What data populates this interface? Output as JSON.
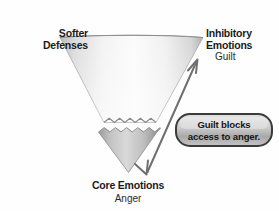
{
  "diagram": {
    "background_color": "#fefefe",
    "funnel": {
      "name": "inverted-triangle-funnel",
      "upper_section_label": "Softer Defenses",
      "lower_section_label": "Core Emotions",
      "divider_style": "zigzag",
      "upper_fill_light": "#fdfdfd",
      "upper_fill_dark": "#b9b9b9",
      "lower_fill_light": "#cfcfcf",
      "lower_fill_dark": "#8f8f8f",
      "outline_color": "#9a9a9a"
    },
    "labels": {
      "softer": "Softer",
      "defenses": "Defenses",
      "inhibitory": "Inhibitory",
      "emotions": "Emotions",
      "guilt": "Guilt",
      "core_emotions": "Core Emotions",
      "anger": "Anger"
    },
    "callout": {
      "name": "guilt-blocks-callout",
      "line1": "Guilt blocks",
      "line2": "access to anger.",
      "fill_light": "#d8d8d8",
      "fill_dark": "#a6a6a6",
      "border_color": "#3d3d3d",
      "text_color": "#161616"
    },
    "arrow": {
      "name": "double-headed-arrow",
      "description": "Double-headed arrow between Core Emotions (Anger) at lower left and Inhibitory Emotions (Guilt) at upper right",
      "color": "#6d6d6d",
      "head_top": "up-arrowhead",
      "head_bottom": "down-arrowhead"
    }
  }
}
